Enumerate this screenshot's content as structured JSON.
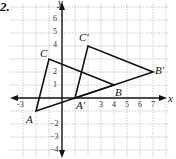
{
  "problem_number": "2.",
  "axes": {
    "x_label": "x",
    "y_label": "y",
    "x_ticks": [
      "-3",
      "3",
      "4",
      "5",
      "6",
      "7"
    ],
    "y_ticks": [
      "6",
      "5",
      "4",
      "2",
      "1",
      "2",
      "3",
      "4"
    ],
    "y_tick_values": [
      6,
      5,
      4,
      2,
      1,
      -2,
      -3,
      -4
    ],
    "x_tick_values": [
      -3,
      3,
      4,
      5,
      6,
      7
    ]
  },
  "triangles": {
    "original": {
      "name": "ABC",
      "vertices": [
        {
          "label": "A",
          "x": -2,
          "y": -1
        },
        {
          "label": "B",
          "x": 4,
          "y": 1
        },
        {
          "label": "C",
          "x": -1,
          "y": 3
        }
      ]
    },
    "image": {
      "name": "A'B'C'",
      "vertices": [
        {
          "label": "A'",
          "x": 1,
          "y": 0
        },
        {
          "label": "B'",
          "x": 7,
          "y": 2
        },
        {
          "label": "C'",
          "x": 2,
          "y": 4
        }
      ]
    }
  },
  "translation": {
    "dx": 3,
    "dy": 1
  }
}
